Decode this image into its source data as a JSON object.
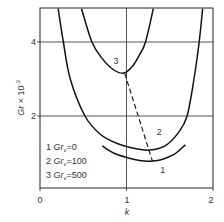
{
  "chart_data": {
    "type": "line",
    "title": "",
    "xlabel": "k",
    "ylabel": "Gr × 10⁻³",
    "xlim": [
      0,
      2
    ],
    "ylim": [
      0,
      4.9
    ],
    "xticks": [
      "0",
      "1",
      "2"
    ],
    "yticks": [
      "2",
      "4"
    ],
    "grid": true,
    "legend_position": "bottom-left",
    "series": [
      {
        "name": "1 Grᵥ=0",
        "label": "1",
        "x": [
          0.72,
          0.85,
          1.0,
          1.15,
          1.27,
          1.4,
          1.55,
          1.68
        ],
        "y": [
          1.19,
          1.0,
          0.88,
          0.8,
          0.78,
          0.82,
          0.96,
          1.22
        ]
      },
      {
        "name": "2 Grᵥ=100",
        "label": "2",
        "x": [
          0.21,
          0.27,
          0.35,
          0.52,
          0.7,
          0.9,
          1.1,
          1.27,
          1.45,
          1.6,
          1.7,
          1.78,
          1.84,
          1.88
        ],
        "y": [
          4.9,
          4.0,
          3.0,
          2.0,
          1.5,
          1.25,
          1.12,
          1.08,
          1.2,
          1.55,
          2.0,
          3.0,
          4.0,
          4.9
        ]
      },
      {
        "name": "3 Grᵥ=500",
        "label": "3",
        "x": [
          0.48,
          0.6,
          0.72,
          0.85,
          0.97,
          1.07,
          1.15,
          1.22,
          1.31
        ],
        "y": [
          4.9,
          4.0,
          3.55,
          3.25,
          3.16,
          3.35,
          3.65,
          4.0,
          4.9
        ]
      }
    ],
    "annotations": [
      {
        "type": "dashed-line",
        "from": [
          0.98,
          3.15
        ],
        "to": [
          1.3,
          0.78
        ]
      },
      {
        "type": "curve-label",
        "text": "3",
        "at": [
          0.88,
          3.4
        ]
      },
      {
        "type": "curve-label",
        "text": "2",
        "at": [
          1.38,
          1.48
        ]
      },
      {
        "type": "curve-label",
        "text": "1",
        "at": [
          1.42,
          0.45
        ]
      }
    ],
    "legend": [
      {
        "num": "1",
        "sym": "Gr",
        "sub": "v",
        "val": "=0"
      },
      {
        "num": "2",
        "sym": "Gr",
        "sub": "v",
        "val": "=100"
      },
      {
        "num": "3",
        "sym": "Gr",
        "sub": "v",
        "val": "=500"
      }
    ]
  }
}
